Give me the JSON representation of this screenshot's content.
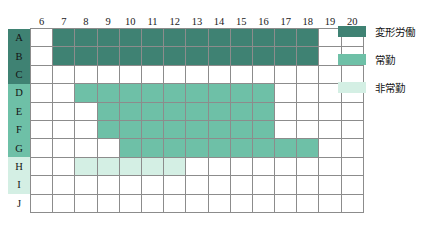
{
  "chart_data": {
    "type": "heatmap",
    "title": "",
    "xlabel": "",
    "ylabel": "",
    "grid": true,
    "legend_position": "right",
    "columns": [
      "6",
      "7",
      "8",
      "9",
      "10",
      "11",
      "12",
      "13",
      "14",
      "15",
      "16",
      "17",
      "18",
      "19",
      "20"
    ],
    "rows": [
      "A",
      "B",
      "C",
      "D",
      "E",
      "F",
      "G",
      "H",
      "I",
      "J"
    ],
    "categories": [
      {
        "key": "f1",
        "label": "変形労働",
        "color": "#3f8273"
      },
      {
        "key": "f2",
        "label": "常勤",
        "color": "#6ec0a7"
      },
      {
        "key": "f3",
        "label": "非常勤",
        "color": "#d4efe4"
      }
    ],
    "row_groups": [
      {
        "row": "A",
        "category": "f1",
        "color": "#3f8273"
      },
      {
        "row": "B",
        "category": "f1",
        "color": "#3f8273"
      },
      {
        "row": "C",
        "category": "f1",
        "color": "#3f8273"
      },
      {
        "row": "D",
        "category": "f2",
        "color": "#6ec0a7"
      },
      {
        "row": "E",
        "category": "f2",
        "color": "#6ec0a7"
      },
      {
        "row": "F",
        "category": "f2",
        "color": "#6ec0a7"
      },
      {
        "row": "G",
        "category": "f2",
        "color": "#6ec0a7"
      },
      {
        "row": "H",
        "category": "f3",
        "color": "#d4efe4"
      },
      {
        "row": "I",
        "category": "f3",
        "color": "#d4efe4"
      },
      {
        "row": "J",
        "category": "",
        "color": "#ffffff"
      }
    ],
    "cells": [
      {
        "row": "A",
        "values": [
          "",
          "f1",
          "f1",
          "f1",
          "f1",
          "f1",
          "f1",
          "f1",
          "f1",
          "f1",
          "f1",
          "f1",
          "f1",
          "",
          ""
        ]
      },
      {
        "row": "B",
        "values": [
          "",
          "f1",
          "f1",
          "f1",
          "f1",
          "f1",
          "f1",
          "f1",
          "f1",
          "f1",
          "f1",
          "f1",
          "f1",
          "",
          ""
        ]
      },
      {
        "row": "C",
        "values": [
          "",
          "",
          "",
          "",
          "",
          "",
          "",
          "",
          "",
          "",
          "",
          "",
          "",
          "",
          ""
        ]
      },
      {
        "row": "D",
        "values": [
          "",
          "",
          "f2",
          "f2",
          "f2",
          "f2",
          "f2",
          "f2",
          "f2",
          "f2",
          "f2",
          "",
          "",
          "",
          ""
        ]
      },
      {
        "row": "E",
        "values": [
          "",
          "",
          "",
          "f2",
          "f2",
          "f2",
          "f2",
          "f2",
          "f2",
          "f2",
          "f2",
          "",
          "",
          "",
          ""
        ]
      },
      {
        "row": "F",
        "values": [
          "",
          "",
          "",
          "f2",
          "f2",
          "f2",
          "f2",
          "f2",
          "f2",
          "f2",
          "f2",
          "",
          "",
          "",
          ""
        ]
      },
      {
        "row": "G",
        "values": [
          "",
          "",
          "",
          "",
          "f2",
          "f2",
          "f2",
          "f2",
          "f2",
          "f2",
          "f2",
          "f2",
          "f2",
          "",
          ""
        ]
      },
      {
        "row": "H",
        "values": [
          "",
          "",
          "f3",
          "f3",
          "f3",
          "f3",
          "f3",
          "",
          "",
          "",
          "",
          "",
          "",
          "",
          ""
        ]
      },
      {
        "row": "I",
        "values": [
          "",
          "",
          "",
          "",
          "",
          "",
          "",
          "",
          "",
          "",
          "",
          "",
          "",
          "",
          ""
        ]
      },
      {
        "row": "J",
        "values": [
          "",
          "",
          "",
          "",
          "",
          "",
          "",
          "",
          "",
          "",
          "",
          "",
          "",
          "",
          ""
        ]
      }
    ],
    "spans": [
      {
        "row": "A",
        "category": "変形労働",
        "start": "7",
        "end": "18"
      },
      {
        "row": "B",
        "category": "変形労働",
        "start": "7",
        "end": "18"
      },
      {
        "row": "D",
        "category": "常勤",
        "start": "8",
        "end": "16"
      },
      {
        "row": "E",
        "category": "常勤",
        "start": "9",
        "end": "16"
      },
      {
        "row": "F",
        "category": "常勤",
        "start": "9",
        "end": "16"
      },
      {
        "row": "G",
        "category": "常勤",
        "start": "10",
        "end": "18"
      },
      {
        "row": "H",
        "category": "非常勤",
        "start": "8",
        "end": "12"
      }
    ]
  },
  "legend": {
    "items": [
      {
        "label": "変形労働",
        "color": "#3f8273"
      },
      {
        "label": "常勤",
        "color": "#6ec0a7"
      },
      {
        "label": "非常勤",
        "color": "#d4efe4"
      }
    ]
  }
}
